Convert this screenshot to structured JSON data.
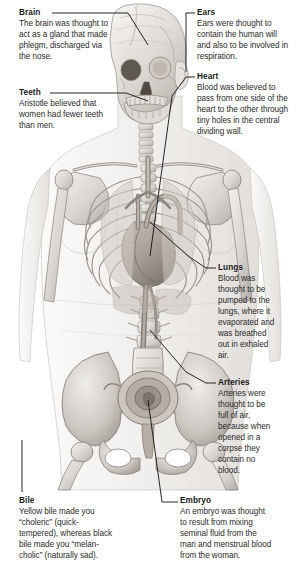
{
  "figure": {
    "style": "grayscale pencil medical illustration",
    "background_color": "#ffffff",
    "ink_color": "#1a1a1a",
    "bone_light": "#e9e7e4",
    "bone_mid": "#bdb9b4",
    "bone_dark": "#8d8882",
    "organ_tint": "#a9a29b",
    "skin_outline": "#cfcbc6"
  },
  "annotations": [
    {
      "id": "brain",
      "title": "Brain",
      "body": "The brain was thought to\nact as a gland that made\nphlegm, discharged via\nthe nose."
    },
    {
      "id": "teeth",
      "title": "Teeth",
      "body": "Aristotle believed that\nwomen had fewer teeth\nthan men."
    },
    {
      "id": "ears",
      "title": "Ears",
      "body": "Ears were thought to\ncontain the human will\nand also to be involved in\nrespiration."
    },
    {
      "id": "heart",
      "title": "Heart",
      "body": "Blood was believed to\npass from one side of the\nheart to the other through\ntiny holes in the central\ndividing wall."
    },
    {
      "id": "lungs",
      "title": "Lungs",
      "body": "Blood was\nthought to be\npumped to the\nlungs, where it\nevaporated and\nwas breathed\nout in exhaled\nair."
    },
    {
      "id": "arteries",
      "title": "Arteries",
      "body": "Arteries were\nthought to be\nfull of air,\nbecause when\nopened in a\ncorpse they\ncontain no\nblood."
    },
    {
      "id": "bile",
      "title": "Bile",
      "body": "Yellow bile made you\n“choleric” (quick-\ntempered), whereas black\nbile made you “melan-\ncholic” (naturally sad)."
    },
    {
      "id": "embryo",
      "title": "Embryo",
      "body": "An embryo was thought\nto result from mixing\nseminal fluid from the\nman and menstrual blood\nfrom the woman."
    }
  ]
}
